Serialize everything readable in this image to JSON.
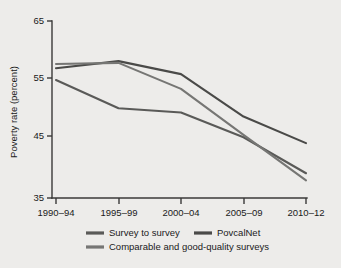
{
  "chart_data": {
    "type": "line",
    "title": "",
    "xlabel": "",
    "ylabel": "Poverty rate (percent)",
    "categories": [
      "1990–94",
      "1995–99",
      "2000–04",
      "2005–09",
      "2010–12"
    ],
    "ylim": [
      35,
      65
    ],
    "yticks": [
      35,
      45,
      55,
      65
    ],
    "ytick_labels": [
      "35",
      "45",
      "55",
      "65"
    ],
    "grid": false,
    "legend_position": "bottom",
    "series": [
      {
        "name": "Survey to survey",
        "color": "#5a5a58",
        "values": [
          55.0,
          50.2,
          49.5,
          45.3,
          39.2
        ]
      },
      {
        "name": "PovcalNet",
        "color": "#4a4a48",
        "values": [
          57.0,
          58.2,
          56.0,
          48.8,
          44.3
        ]
      },
      {
        "name": "Comparable and good-quality surveys",
        "color": "#767674",
        "values": [
          57.7,
          57.9,
          53.5,
          45.7,
          38.0
        ]
      }
    ]
  },
  "legend": {
    "entries": [
      {
        "label": "Survey to survey"
      },
      {
        "label": "PovcalNet"
      },
      {
        "label": "Comparable and good-quality surveys"
      }
    ]
  },
  "axes": {
    "y_axis_title": "Poverty rate (percent)",
    "y_tick_labels": [
      "65",
      "55",
      "45",
      "35"
    ],
    "x_tick_labels": [
      "1990–94",
      "1995–99",
      "2000–04",
      "2005–09",
      "2010–12"
    ]
  }
}
